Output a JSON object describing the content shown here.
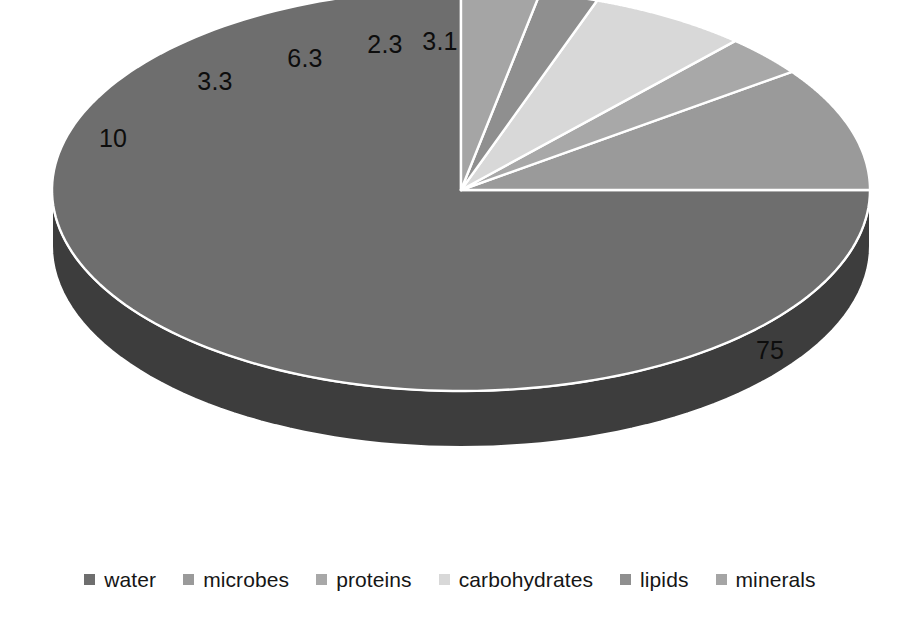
{
  "chart_data": {
    "type": "pie",
    "title": "",
    "subtitle": "",
    "xlabel": "",
    "ylabel": "",
    "style": "3d-exploded-none",
    "grid": false,
    "legend_position": "bottom",
    "start_angle_deg": 0,
    "direction": "counter-clockwise",
    "units": "percent",
    "categories": [
      "water",
      "microbes",
      "proteins",
      "carbohydrates",
      "lipids",
      "minerals"
    ],
    "values": [
      75,
      10,
      3.3,
      6.3,
      2.3,
      3.1
    ],
    "data_labels": [
      "75",
      "10",
      "3.3",
      "6.3",
      "2.3",
      "3.1"
    ],
    "colors": [
      "#6e6e6e",
      "#9a9a9a",
      "#a8a8a8",
      "#d8d8d8",
      "#8f8f8f",
      "#a5a5a5"
    ],
    "side_colors": [
      "#3d3d3d",
      "#595959",
      "#636363",
      "#8a8a8a",
      "#525252",
      "#606060"
    ],
    "slices": [
      {
        "label": "water",
        "value": 75,
        "data_label": "75",
        "color": "#6e6e6e",
        "side_color": "#3d3d3d"
      },
      {
        "label": "microbes",
        "value": 10,
        "data_label": "10",
        "color": "#9a9a9a",
        "side_color": "#595959"
      },
      {
        "label": "proteins",
        "value": 3.3,
        "data_label": "3.3",
        "color": "#a8a8a8",
        "side_color": "#636363"
      },
      {
        "label": "carbohydrates",
        "value": 6.3,
        "data_label": "6.3",
        "color": "#d8d8d8",
        "side_color": "#8a8a8a"
      },
      {
        "label": "lipids",
        "value": 2.3,
        "data_label": "2.3",
        "color": "#8f8f8f",
        "side_color": "#525252"
      },
      {
        "label": "minerals",
        "value": 3.1,
        "data_label": "3.1",
        "color": "#a5a5a5",
        "side_color": "#606060"
      }
    ]
  },
  "labels": {
    "water": "75",
    "microbes": "10",
    "proteins": "3.3",
    "carbohydrates": "6.3",
    "lipids": "2.3",
    "minerals": "3.1"
  },
  "legend": {
    "items": [
      {
        "label": "water",
        "color": "#6e6e6e"
      },
      {
        "label": "microbes",
        "color": "#9a9a9a"
      },
      {
        "label": "proteins",
        "color": "#a8a8a8"
      },
      {
        "label": "carbohydrates",
        "color": "#d8d8d8"
      },
      {
        "label": "lipids",
        "color": "#8f8f8f"
      },
      {
        "label": "minerals",
        "color": "#a5a5a5"
      }
    ]
  },
  "colors": {
    "background": "#ffffff",
    "separator": "#ffffff",
    "label_text": "#0d0d0d",
    "legend_text": "#161616"
  }
}
